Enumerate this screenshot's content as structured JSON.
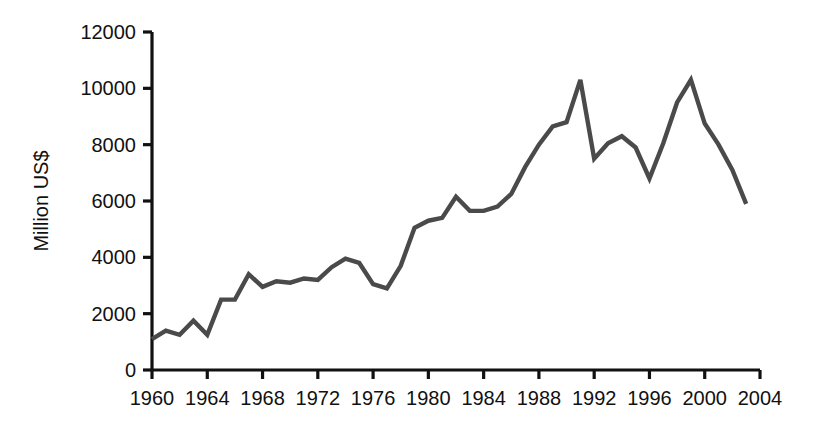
{
  "chart_data": {
    "type": "line",
    "title": "",
    "subtitle": "",
    "xlabel": "",
    "ylabel": "Million US$",
    "xlim": [
      1960,
      2004
    ],
    "ylim": [
      0,
      12000
    ],
    "grid": false,
    "legend": false,
    "legend_position": "none",
    "line_color": "#4a4a4a",
    "axis_color": "#111111",
    "background_color": "#ffffff",
    "x_tick_labels": [
      "1960",
      "1964",
      "1968",
      "1972",
      "1976",
      "1980",
      "1984",
      "1988",
      "1992",
      "1996",
      "2000",
      "2004"
    ],
    "x_tick_values": [
      1960,
      1964,
      1968,
      1972,
      1976,
      1980,
      1984,
      1988,
      1992,
      1996,
      2000,
      2004
    ],
    "y_tick_labels": [
      "0",
      "2000",
      "4000",
      "6000",
      "8000",
      "10000",
      "12000"
    ],
    "y_tick_values": [
      0,
      2000,
      4000,
      6000,
      8000,
      10000,
      12000
    ],
    "x": [
      1960,
      1961,
      1962,
      1963,
      1964,
      1965,
      1966,
      1967,
      1968,
      1969,
      1970,
      1971,
      1972,
      1973,
      1974,
      1975,
      1976,
      1977,
      1978,
      1979,
      1980,
      1981,
      1982,
      1983,
      1984,
      1985,
      1986,
      1987,
      1988,
      1989,
      1990,
      1991,
      1992,
      1993,
      1994,
      1995,
      1996,
      1997,
      1998,
      1999,
      2000,
      2001,
      2002,
      2003
    ],
    "values": [
      1100,
      1400,
      1250,
      1750,
      1250,
      2500,
      2500,
      3400,
      2950,
      3150,
      3100,
      3250,
      3200,
      3650,
      3950,
      3800,
      3050,
      2900,
      3700,
      5050,
      5300,
      5400,
      6150,
      5650,
      5650,
      5800,
      6250,
      7200,
      8000,
      8650,
      8800,
      10300,
      7500,
      8050,
      8300,
      7900,
      6800,
      8050,
      9500,
      10300,
      8750,
      8000,
      7100,
      5900
    ],
    "series": [
      {
        "name": "Million US$",
        "values": [
          1100,
          1400,
          1250,
          1750,
          1250,
          2500,
          2500,
          3400,
          2950,
          3150,
          3100,
          3250,
          3200,
          3650,
          3950,
          3800,
          3050,
          2900,
          3700,
          5050,
          5300,
          5400,
          6150,
          5650,
          5650,
          5800,
          6250,
          7200,
          8000,
          8650,
          8800,
          10300,
          7500,
          8050,
          8300,
          7900,
          6800,
          8050,
          9500,
          10300,
          8750,
          8000,
          7100,
          5900
        ]
      }
    ],
    "annotations": []
  }
}
